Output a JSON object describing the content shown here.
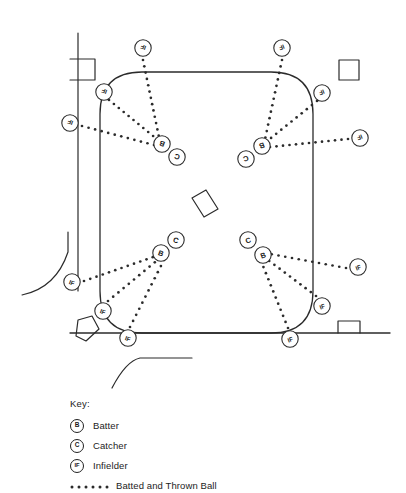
{
  "diagram": {
    "stroke_color": "#2b2b2b",
    "dot_color": "#2b2b2b",
    "background": "#ffffff",
    "field": {
      "shape": "rounded-rectangle",
      "left": 100,
      "top": 72,
      "right": 313,
      "bottom": 333,
      "corner_radius": 42
    },
    "markers": [
      {
        "id": "if-top-left-outer",
        "label": "IF",
        "x": 143,
        "y": 48,
        "rotation": 200
      },
      {
        "id": "if-top-left-inner",
        "label": "IF",
        "x": 104,
        "y": 92,
        "rotation": 200
      },
      {
        "id": "if-left-upper",
        "label": "IF",
        "x": 70,
        "y": 123,
        "rotation": 200
      },
      {
        "id": "b-top-left",
        "label": "B",
        "x": 162,
        "y": 144,
        "rotation": 200
      },
      {
        "id": "c-top-left",
        "label": "C",
        "x": 177,
        "y": 157,
        "rotation": 200
      },
      {
        "id": "if-top-right-outer",
        "label": "IF",
        "x": 282,
        "y": 48,
        "rotation": 160
      },
      {
        "id": "if-top-right-inner",
        "label": "IF",
        "x": 322,
        "y": 93,
        "rotation": 160
      },
      {
        "id": "if-right-upper",
        "label": "IF",
        "x": 360,
        "y": 138,
        "rotation": 160
      },
      {
        "id": "b-top-right",
        "label": "B",
        "x": 262,
        "y": 146,
        "rotation": 160
      },
      {
        "id": "c-top-right",
        "label": "C",
        "x": 246,
        "y": 159,
        "rotation": 160
      },
      {
        "id": "if-left-lower",
        "label": "IF",
        "x": 72,
        "y": 282,
        "rotation": 20
      },
      {
        "id": "if-bottom-left-inn",
        "label": "IF",
        "x": 103,
        "y": 311,
        "rotation": 20
      },
      {
        "id": "if-bottom-left-out",
        "label": "IF",
        "x": 128,
        "y": 338,
        "rotation": 20
      },
      {
        "id": "b-bottom-left",
        "label": "B",
        "x": 161,
        "y": 253,
        "rotation": 20
      },
      {
        "id": "c-bottom-left",
        "label": "C",
        "x": 176,
        "y": 240,
        "rotation": 20
      },
      {
        "id": "if-right-lower",
        "label": "IF",
        "x": 358,
        "y": 267,
        "rotation": 340
      },
      {
        "id": "if-bottom-right-in",
        "label": "IF",
        "x": 322,
        "y": 306,
        "rotation": 340
      },
      {
        "id": "if-bottom-right-ot",
        "label": "IF",
        "x": 290,
        "y": 339,
        "rotation": 340
      },
      {
        "id": "b-bottom-right",
        "label": "B",
        "x": 263,
        "y": 255,
        "rotation": 340
      },
      {
        "id": "c-bottom-right",
        "label": "C",
        "x": 248,
        "y": 240,
        "rotation": 340
      }
    ],
    "objects": [
      {
        "id": "left-boundary-line",
        "type": "line"
      },
      {
        "id": "bench-rectangle-top-left",
        "type": "rectangle"
      },
      {
        "id": "square-top-right",
        "type": "square"
      },
      {
        "id": "square-bottom-right",
        "type": "square"
      },
      {
        "id": "home-plate-pentagon",
        "type": "pentagon"
      },
      {
        "id": "center-mat-rectangle",
        "type": "tilted-rectangle"
      },
      {
        "id": "backstop-arc-left",
        "type": "arc"
      },
      {
        "id": "backstop-arc-bottom",
        "type": "arc"
      },
      {
        "id": "bottom-boundary-line",
        "type": "line"
      }
    ]
  },
  "key": {
    "title": "Key:",
    "entries": [
      {
        "badge": "B",
        "label": "Batter"
      },
      {
        "badge": "C",
        "label": "Catcher"
      },
      {
        "badge": "IF",
        "label": "Infielder"
      },
      {
        "badge": "",
        "label": "Batted and Thrown Ball"
      }
    ]
  }
}
